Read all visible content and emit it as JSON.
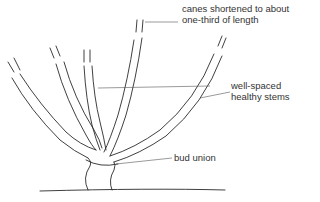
{
  "diagram": {
    "labels": {
      "canes": [
        "canes shortened to about",
        "one-third of length"
      ],
      "stems": [
        "well-spaced",
        "healthy stems"
      ],
      "bud_union": "bud union"
    },
    "colors": {
      "line": "#2a2a2a",
      "leader": "#555555",
      "background": "#ffffff"
    }
  }
}
